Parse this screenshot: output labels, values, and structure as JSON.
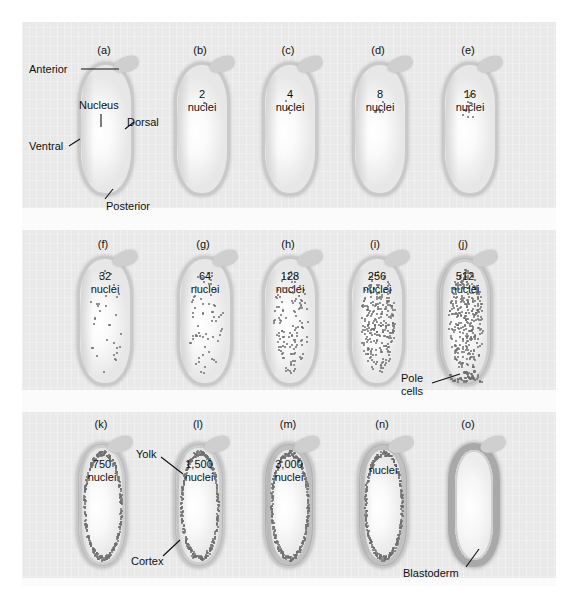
{
  "figure": {
    "background_color": "#e9e9e9",
    "page_color": "#ffffff"
  },
  "anatomy_labels": {
    "anterior": "Anterior",
    "posterior": "Posterior",
    "dorsal": "Dorsal",
    "ventral": "Ventral",
    "nucleus": "Nucleus",
    "pole_cells": "Pole\ncells",
    "yolk": "Yolk",
    "cortex": "Cortex",
    "blastoderm": "Blastoderm"
  },
  "panels": [
    {
      "letter": "(a)",
      "caption": "",
      "nuclei": 1,
      "row": 1,
      "col": 1
    },
    {
      "letter": "(b)",
      "caption": "2\nnuclei",
      "nuclei": 2,
      "row": 1,
      "col": 2
    },
    {
      "letter": "(c)",
      "caption": "4\nnuclei",
      "nuclei": 4,
      "row": 1,
      "col": 3
    },
    {
      "letter": "(d)",
      "caption": "8\nnuclei",
      "nuclei": 8,
      "row": 1,
      "col": 4
    },
    {
      "letter": "(e)",
      "caption": "16\nnuclei",
      "nuclei": 16,
      "row": 1,
      "col": 5
    },
    {
      "letter": "(f)",
      "caption": "32\nnuclei",
      "nuclei": 32,
      "row": 2,
      "col": 1
    },
    {
      "letter": "(g)",
      "caption": "64\nnuclei",
      "nuclei": 64,
      "row": 2,
      "col": 2
    },
    {
      "letter": "(h)",
      "caption": "128\nnuclei",
      "nuclei": 128,
      "row": 2,
      "col": 3
    },
    {
      "letter": "(i)",
      "caption": "256\nnuclei",
      "nuclei": 256,
      "row": 2,
      "col": 4
    },
    {
      "letter": "(j)",
      "caption": "512\nnuclei",
      "nuclei": 512,
      "row": 2,
      "col": 5
    },
    {
      "letter": "(k)",
      "caption": "750\nnuclei",
      "nuclei": 750,
      "row": 3,
      "col": 1
    },
    {
      "letter": "(l)",
      "caption": "1,500\nnuclei",
      "nuclei": 1500,
      "row": 3,
      "col": 2
    },
    {
      "letter": "(m)",
      "caption": "3,000\nnuclei",
      "nuclei": 3000,
      "row": 3,
      "col": 3
    },
    {
      "letter": "(n)",
      "caption": "nuclei",
      "nuclei": 6000,
      "row": 3,
      "col": 4
    },
    {
      "letter": "(o)",
      "caption": "",
      "nuclei": 0,
      "row": 3,
      "col": 5
    }
  ],
  "chart_data": {
    "type": "diagram-series",
    "categories": [
      "(a)",
      "(b)",
      "(c)",
      "(d)",
      "(e)",
      "(f)",
      "(g)",
      "(h)",
      "(i)",
      "(j)",
      "(k)",
      "(l)",
      "(m)",
      "(n)",
      "(o)"
    ],
    "series": [
      {
        "name": "Nuclei per embryo",
        "values": [
          1,
          2,
          4,
          8,
          16,
          32,
          64,
          128,
          256,
          512,
          750,
          1500,
          3000,
          6000,
          6000
        ]
      }
    ],
    "value_labels": [
      "",
      "2 nuclei",
      "4 nuclei",
      "8 nuclei",
      "16 nuclei",
      "32 nuclei",
      "64 nuclei",
      "128 nuclei",
      "256 nuclei",
      "512 nuclei",
      "750 nuclei",
      "1,500 nuclei",
      "3,000 nuclei",
      "nuclei",
      ""
    ],
    "annotations": [
      "Anterior",
      "Posterior",
      "Dorsal",
      "Ventral",
      "Nucleus",
      "Pole cells",
      "Yolk",
      "Cortex",
      "Blastoderm"
    ],
    "xlabel": "Developmental stage",
    "ylabel": "Number of nuclei",
    "grid": false,
    "legend": "none"
  }
}
